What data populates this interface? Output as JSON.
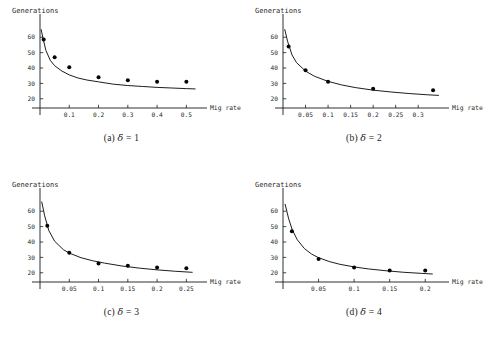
{
  "figure": {
    "panels": [
      {
        "id": "panel-a",
        "caption_index": "(a)",
        "caption_symbol": "δ",
        "caption_equals": "= 1",
        "caption_full": "(a) δ = 1",
        "chart_data": {
          "type": "scatter",
          "title": "",
          "xlabel": "Mig rate",
          "ylabel": "Generations",
          "xticks": [
            0.1,
            0.2,
            0.3,
            0.4,
            0.5
          ],
          "xtick_labels": [
            "0.1",
            "0.2",
            "0.3",
            "0.4",
            "0.5"
          ],
          "yticks": [
            20,
            30,
            40,
            50,
            60
          ],
          "ytick_labels": [
            "20",
            "30",
            "40",
            "50",
            "60"
          ],
          "xlim": [
            0,
            0.55
          ],
          "ylim": [
            14,
            66
          ],
          "grid": false,
          "legend": "none",
          "series": [
            {
              "name": "observed",
              "type": "scatter",
              "x": [
                0.0125,
                0.05,
                0.1,
                0.2,
                0.3,
                0.4,
                0.5
              ],
              "y": [
                58.5,
                47.0,
                40.5,
                34.0,
                32.0,
                31.0,
                31.0
              ]
            },
            {
              "name": "fitted curve",
              "type": "line",
              "x": [
                0.004,
                0.01,
                0.02,
                0.035,
                0.05,
                0.075,
                0.1,
                0.13,
                0.16,
                0.2,
                0.25,
                0.3,
                0.35,
                0.4,
                0.45,
                0.5,
                0.53
              ],
              "y": [
                65.0,
                59.5,
                51.5,
                45.0,
                41.5,
                38.0,
                35.5,
                33.5,
                32.2,
                31.0,
                29.5,
                28.6,
                28.0,
                27.4,
                27.0,
                26.6,
                26.4
              ]
            }
          ]
        }
      },
      {
        "id": "panel-b",
        "caption_index": "(b)",
        "caption_symbol": "δ",
        "caption_equals": "= 2",
        "caption_full": "(b) δ = 2",
        "chart_data": {
          "type": "scatter",
          "title": "",
          "xlabel": "Mig rate",
          "ylabel": "Generations",
          "xticks": [
            0.05,
            0.1,
            0.15,
            0.2,
            0.25,
            0.3
          ],
          "xtick_labels": [
            "0.05",
            "0.1",
            "0.15",
            "0.2",
            "0.25",
            "0.3"
          ],
          "yticks": [
            20,
            30,
            40,
            50,
            60
          ],
          "ytick_labels": [
            "20",
            "30",
            "40",
            "50",
            "60"
          ],
          "xlim": [
            0,
            0.355
          ],
          "ylim": [
            14,
            66
          ],
          "grid": false,
          "legend": "none",
          "series": [
            {
              "name": "observed",
              "type": "scatter",
              "x": [
                0.0125,
                0.05,
                0.1,
                0.2,
                0.333
              ],
              "y": [
                54.0,
                38.5,
                31.0,
                26.5,
                25.5
              ]
            },
            {
              "name": "fitted curve",
              "type": "line",
              "x": [
                0.004,
                0.01,
                0.02,
                0.03,
                0.05,
                0.07,
                0.1,
                0.13,
                0.16,
                0.2,
                0.24,
                0.28,
                0.32,
                0.345
              ],
              "y": [
                65.0,
                57.5,
                48.5,
                43.5,
                38.0,
                34.6,
                31.3,
                29.0,
                27.3,
                25.6,
                24.4,
                23.4,
                22.6,
                22.2
              ]
            }
          ]
        }
      },
      {
        "id": "panel-c",
        "caption_index": "(c)",
        "caption_symbol": "δ",
        "caption_equals": "= 3",
        "caption_full": "(c) δ = 3",
        "chart_data": {
          "type": "scatter",
          "title": "",
          "xlabel": "Mig rate",
          "ylabel": "Generations",
          "xticks": [
            0.05,
            0.1,
            0.15,
            0.2,
            0.25
          ],
          "xtick_labels": [
            "0.05",
            "0.1",
            "0.15",
            "0.2",
            "0.25"
          ],
          "yticks": [
            20,
            30,
            40,
            50,
            60
          ],
          "ytick_labels": [
            "20",
            "30",
            "40",
            "50",
            "60"
          ],
          "xlim": [
            0,
            0.275
          ],
          "ylim": [
            14,
            66
          ],
          "grid": false,
          "legend": "none",
          "series": [
            {
              "name": "observed",
              "type": "scatter",
              "x": [
                0.0125,
                0.05,
                0.1,
                0.15,
                0.2,
                0.25
              ],
              "y": [
                50.5,
                33.0,
                26.0,
                24.5,
                23.5,
                23.0
              ]
            },
            {
              "name": "fitted curve",
              "type": "line",
              "x": [
                0.003,
                0.008,
                0.015,
                0.025,
                0.04,
                0.05,
                0.07,
                0.09,
                0.11,
                0.14,
                0.17,
                0.2,
                0.23,
                0.26
              ],
              "y": [
                66.0,
                57.0,
                47.5,
                40.5,
                35.0,
                32.8,
                29.8,
                27.8,
                26.3,
                24.4,
                23.0,
                21.9,
                21.0,
                20.3
              ]
            }
          ]
        }
      },
      {
        "id": "panel-d",
        "caption_index": "(d)",
        "caption_symbol": "δ",
        "caption_equals": "= 4",
        "caption_full": "(d) δ = 4",
        "chart_data": {
          "type": "scatter",
          "title": "",
          "xlabel": "Mig rate",
          "ylabel": "Generations",
          "xticks": [
            0.05,
            0.1,
            0.15,
            0.2
          ],
          "xtick_labels": [
            "0.05",
            "0.1",
            "0.15",
            "0.2"
          ],
          "yticks": [
            20,
            30,
            40,
            50,
            60
          ],
          "ytick_labels": [
            "20",
            "30",
            "40",
            "50",
            "60"
          ],
          "xlim": [
            0,
            0.225
          ],
          "ylim": [
            14,
            66
          ],
          "grid": false,
          "legend": "none",
          "series": [
            {
              "name": "observed",
              "type": "scatter",
              "x": [
                0.0125,
                0.05,
                0.1,
                0.15,
                0.2
              ],
              "y": [
                47.0,
                29.0,
                23.5,
                21.5,
                21.5
              ]
            },
            {
              "name": "fitted curve",
              "type": "line",
              "x": [
                0.003,
                0.008,
                0.013,
                0.02,
                0.03,
                0.04,
                0.05,
                0.065,
                0.08,
                0.1,
                0.12,
                0.145,
                0.17,
                0.195,
                0.21
              ],
              "y": [
                64.5,
                55.0,
                48.0,
                41.5,
                35.8,
                32.2,
                29.8,
                27.3,
                25.5,
                23.8,
                22.5,
                21.3,
                20.3,
                19.6,
                19.2
              ]
            }
          ]
        }
      }
    ]
  }
}
